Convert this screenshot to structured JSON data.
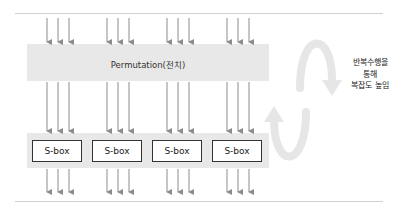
{
  "permutation": {
    "label": "Permutation(전치)"
  },
  "sboxes": [
    {
      "label": "S-box"
    },
    {
      "label": "S-box"
    },
    {
      "label": "S-box"
    },
    {
      "label": "S-box"
    }
  ],
  "side_note": {
    "lines": [
      "반복수행을",
      "통해",
      "복잡도 높임"
    ]
  },
  "colors": {
    "band": "#e8e8e8",
    "arrow": "#8c8c8c",
    "cycle_arrow": "#e6e6e6",
    "box_border": "#333333"
  }
}
